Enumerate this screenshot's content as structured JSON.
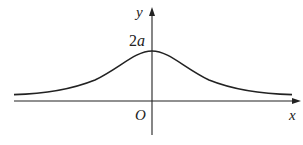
{
  "figure": {
    "axes": {
      "x_label": "x",
      "y_label": "y",
      "origin_label": "O"
    },
    "annotations": {
      "peak_label_coef": "2",
      "peak_label_var": "a"
    },
    "colors": {
      "stroke": "#222222",
      "background": "#ffffff"
    }
  }
}
